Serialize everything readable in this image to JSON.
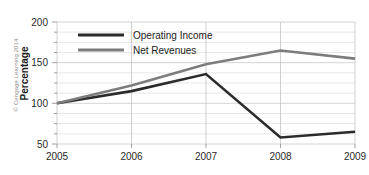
{
  "credit": "© Cengage Learning 2014",
  "chart_data": {
    "type": "line",
    "title": "",
    "xlabel": "",
    "ylabel": "Percentage",
    "categories": [
      "2005",
      "2006",
      "2007",
      "2008",
      "2009"
    ],
    "x": [
      2005,
      2006,
      2007,
      2008,
      2009
    ],
    "series": [
      {
        "name": "Operating Income",
        "color": "#2b2b2b",
        "values": [
          100,
          115,
          136,
          58,
          65
        ]
      },
      {
        "name": "Net Revenues",
        "color": "#7d7d7d",
        "values": [
          100,
          122,
          148,
          165,
          155
        ]
      }
    ],
    "ylim": [
      50,
      200
    ],
    "ytick_labels": [
      "200",
      "150",
      "100",
      "50"
    ],
    "yticks": [
      200,
      150,
      100,
      50
    ],
    "yminor_step": 12.5,
    "xtick_labels": [
      "2005",
      "2006",
      "2007",
      "2008",
      "2009"
    ],
    "grid": true,
    "legend_position": "top-left-inside"
  }
}
